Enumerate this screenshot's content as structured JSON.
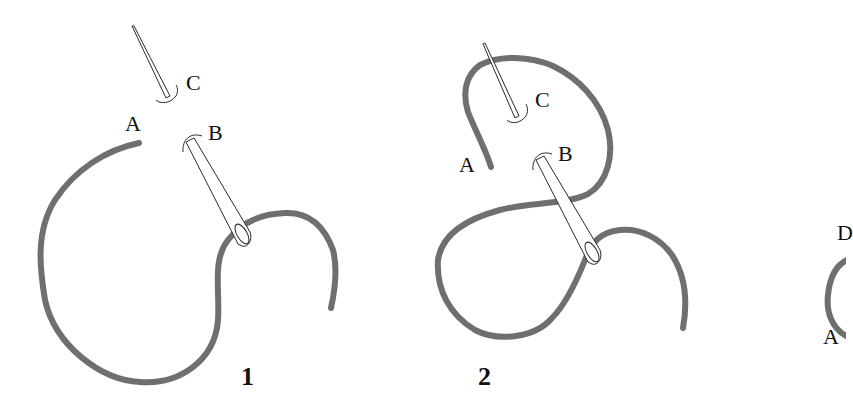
{
  "figure": {
    "colors": {
      "thread": "#6f6f6f",
      "needle_outline": "#2a2a2a",
      "background": "#ffffff"
    },
    "panels": [
      {
        "step": "1",
        "labels": {
          "a": "A",
          "b": "B",
          "c": "C"
        }
      },
      {
        "step": "2",
        "labels": {
          "a": "A",
          "b": "B",
          "c": "C"
        }
      },
      {
        "step": "",
        "labels": {
          "a": "A",
          "d": "D"
        }
      }
    ]
  }
}
